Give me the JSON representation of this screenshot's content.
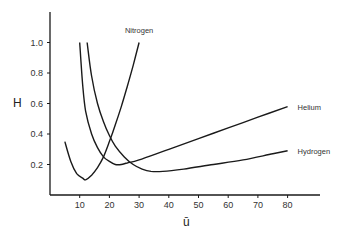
{
  "chart_data": {
    "type": "line",
    "title": "",
    "xlabel": "ū",
    "ylabel": "H",
    "xlim": [
      0,
      90
    ],
    "ylim": [
      0,
      1.2
    ],
    "grid": false,
    "legend": "inline labels at curve ends",
    "x_ticks": [
      10,
      20,
      30,
      40,
      50,
      60,
      70,
      80
    ],
    "x_tick_labels": [
      "10",
      "20",
      "30",
      "40",
      "50",
      "60",
      "70",
      "80"
    ],
    "y_ticks": [
      0.2,
      0.4,
      0.6,
      0.8,
      1.0
    ],
    "y_tick_labels": [
      "0.2",
      "0.4",
      "0.6",
      "0.8",
      "1.0"
    ],
    "series": [
      {
        "name": "Nitrogen",
        "x": [
          5,
          7,
          9,
          11,
          12,
          14,
          16,
          18,
          20,
          22,
          24,
          26,
          28,
          30
        ],
        "y": [
          0.35,
          0.22,
          0.14,
          0.11,
          0.1,
          0.13,
          0.18,
          0.25,
          0.35,
          0.46,
          0.58,
          0.71,
          0.85,
          1.0
        ]
      },
      {
        "name": "Helium",
        "x": [
          10,
          11,
          12,
          14,
          16,
          18,
          20,
          22,
          24,
          26,
          30,
          40,
          50,
          60,
          70,
          80
        ],
        "y": [
          1.0,
          0.72,
          0.55,
          0.4,
          0.31,
          0.25,
          0.22,
          0.2,
          0.2,
          0.21,
          0.23,
          0.3,
          0.37,
          0.44,
          0.51,
          0.58
        ]
      },
      {
        "name": "Hydrogen",
        "x": [
          12.5,
          14,
          16,
          18,
          20,
          22,
          25,
          28,
          31,
          34,
          38,
          45,
          55,
          65,
          75,
          80
        ],
        "y": [
          1.0,
          0.78,
          0.6,
          0.48,
          0.39,
          0.32,
          0.25,
          0.2,
          0.17,
          0.155,
          0.155,
          0.17,
          0.2,
          0.23,
          0.27,
          0.29
        ]
      }
    ]
  }
}
